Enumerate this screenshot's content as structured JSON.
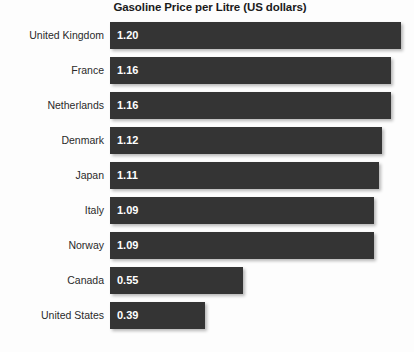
{
  "chart_data": {
    "type": "bar",
    "orientation": "horizontal",
    "title": "Gasoline Price per Litre (US dollars)",
    "xlabel": "",
    "ylabel": "",
    "xlim": [
      0,
      1.25
    ],
    "grid": false,
    "legend": false,
    "value_labels_inside_bars": true,
    "bar_color": "#343434",
    "value_label_color": "#ffffff",
    "background_color": "#fdfdfd",
    "categories": [
      "United Kingdom",
      "France",
      "Netherlands",
      "Denmark",
      "Japan",
      "Italy",
      "Norway",
      "Canada",
      "United States"
    ],
    "values": [
      1.2,
      1.16,
      1.16,
      1.12,
      1.11,
      1.09,
      1.09,
      0.55,
      0.39
    ],
    "value_labels": [
      "1.20",
      "1.16",
      "1.16",
      "1.12",
      "1.11",
      "1.09",
      "1.09",
      "0.55",
      "0.39"
    ],
    "bars": [
      {
        "category": "United Kingdom",
        "value": 1.2,
        "label": "1.20"
      },
      {
        "category": "France",
        "value": 1.16,
        "label": "1.16"
      },
      {
        "category": "Netherlands",
        "value": 1.16,
        "label": "1.16"
      },
      {
        "category": "Denmark",
        "value": 1.12,
        "label": "1.12"
      },
      {
        "category": "Japan",
        "value": 1.11,
        "label": "1.11"
      },
      {
        "category": "Italy",
        "value": 1.09,
        "label": "1.09"
      },
      {
        "category": "Norway",
        "value": 1.09,
        "label": "1.09"
      },
      {
        "category": "Canada",
        "value": 0.55,
        "label": "0.55"
      },
      {
        "category": "United States",
        "value": 0.39,
        "label": "0.39"
      }
    ]
  }
}
